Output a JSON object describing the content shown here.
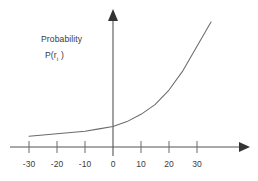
{
  "figure": {
    "background_color": "#ffffff",
    "line_color": "#6b6b6b",
    "axis_color": "#555555",
    "text_color": "#3a3a3a"
  },
  "labels": {
    "probability_line1": "Probability",
    "probability_line2_prefix": "P(r",
    "probability_line2_subscript": "i",
    "probability_line2_suffix": " )"
  },
  "chart_data": {
    "type": "line",
    "title": "",
    "subtitle": "",
    "xlabel": "",
    "ylabel": "Probability P(r i )",
    "xlim": [
      -38,
      38
    ],
    "ylim": [
      0,
      1
    ],
    "grid": false,
    "legend": null,
    "xticks": [
      -30,
      -20,
      -10,
      0,
      10,
      20,
      30
    ],
    "xtick_labels": [
      "-30",
      "-20",
      "-10",
      "0",
      "10",
      "20",
      "30"
    ],
    "yticks": [],
    "ytick_labels": [],
    "axis_arrows": {
      "x_axis": "right",
      "y_axis": "up"
    },
    "series": [
      {
        "name": "probability curve",
        "shape": "exponential-increasing",
        "x": [
          -30,
          -25,
          -20,
          -15,
          -10,
          -5,
          0,
          5,
          10,
          15,
          20,
          25,
          30,
          35
        ],
        "y": [
          0.06,
          0.07,
          0.08,
          0.09,
          0.1,
          0.12,
          0.14,
          0.18,
          0.24,
          0.32,
          0.44,
          0.6,
          0.8,
          1.0
        ]
      }
    ]
  }
}
